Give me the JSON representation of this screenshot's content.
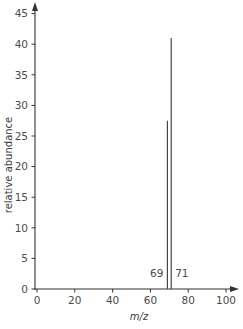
{
  "chart_data": {
    "type": "bar",
    "subtype": "mass-spectrum-stick",
    "title": "",
    "xlabel": "m/z",
    "ylabel": "relative abundance",
    "xlim": [
      0,
      100
    ],
    "ylim": [
      0,
      45
    ],
    "x_ticks": [
      0,
      20,
      40,
      60,
      80,
      100
    ],
    "y_ticks": [
      0,
      5,
      10,
      15,
      20,
      25,
      30,
      35,
      40,
      45
    ],
    "grid": false,
    "legend": null,
    "axes_arrows": true,
    "x": [
      69,
      71
    ],
    "values": [
      27.5,
      41
    ],
    "peak_labels": [
      "69",
      "71"
    ],
    "colors": {
      "axis": "#333333",
      "peak": "#444444",
      "text": "#4a4a4a"
    }
  }
}
